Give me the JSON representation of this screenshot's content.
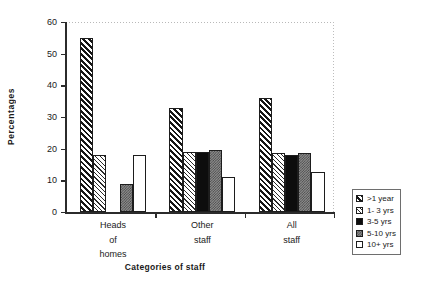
{
  "chart_data": {
    "type": "bar",
    "title": "",
    "xlabel": "Categories of staff",
    "ylabel": "Percentages",
    "ylim": [
      0,
      60
    ],
    "yticks": [
      0,
      10,
      20,
      30,
      40,
      50,
      60
    ],
    "grid": false,
    "legend_position": "right",
    "categories": [
      "Heads of homes",
      "Other staff",
      "All staff"
    ],
    "category_lines": [
      [
        "Heads",
        "of",
        "homes"
      ],
      [
        "Other",
        "staff"
      ],
      [
        "All",
        "staff"
      ]
    ],
    "series": [
      {
        "name": ">1 year",
        "pattern": "dark-diagonal-hatch",
        "values": [
          55,
          33,
          36
        ]
      },
      {
        "name": "1- 3 yrs",
        "pattern": "light-diagonal-hatch",
        "values": [
          18,
          19,
          18.5
        ]
      },
      {
        "name": "3-5 yrs",
        "pattern": "solid-black",
        "values": [
          0,
          19,
          18
        ]
      },
      {
        "name": "5-10 yrs",
        "pattern": "gray-checker",
        "values": [
          9,
          19.5,
          18.5
        ]
      },
      {
        "name": "10+ yrs",
        "pattern": "white-empty",
        "values": [
          18,
          11,
          12.5
        ]
      }
    ]
  }
}
